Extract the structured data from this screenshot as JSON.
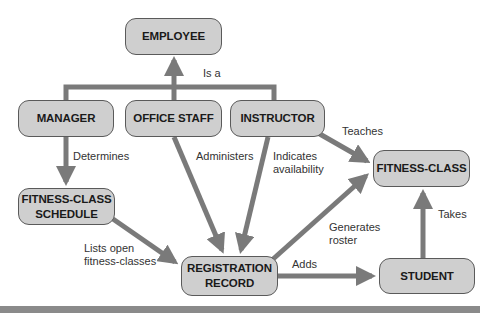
{
  "diagram": {
    "type": "concept-map",
    "colors": {
      "node_fill": "#cfcfcf",
      "node_border": "#5a5a5a",
      "arrow": "#7a7a7a",
      "band": "#8a8a8a"
    },
    "nodes": {
      "employee": "EMPLOYEE",
      "manager": "MANAGER",
      "office_staff": "OFFICE STAFF",
      "instructor": "INSTRUCTOR",
      "fitness_class": "FITNESS-CLASS",
      "schedule": "FITNESS-CLASS\nSCHEDULE",
      "registration": "REGISTRATION\nRECORD",
      "student": "STUDENT"
    },
    "edges": {
      "is_a": "Is a",
      "determines": "Determines",
      "administers": "Administers",
      "indicates": "Indicates\navailability",
      "teaches": "Teaches",
      "lists_open": "Lists open\nfitness-classes",
      "generates": "Generates\nroster",
      "adds": "Adds",
      "takes": "Takes"
    }
  }
}
